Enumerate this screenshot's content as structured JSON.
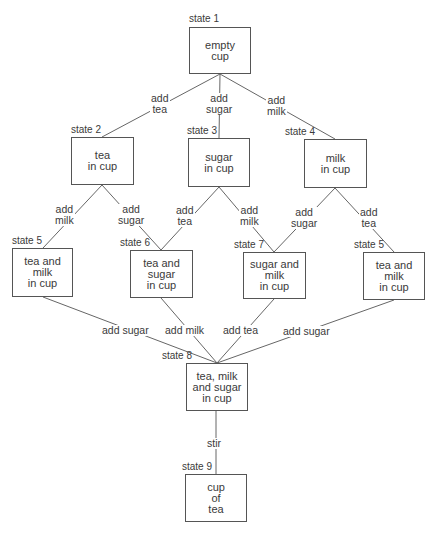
{
  "diagram": {
    "type": "state-transition-tree",
    "states": [
      {
        "id": "s1",
        "label": "state 1",
        "text": "empty\ncup",
        "x": 189,
        "y": 27,
        "w": 62,
        "h": 47
      },
      {
        "id": "s2",
        "label": "state 2",
        "text": "tea\nin cup",
        "x": 71,
        "y": 137,
        "w": 63,
        "h": 48
      },
      {
        "id": "s3",
        "label": "state 3",
        "text": "sugar\nin cup",
        "x": 188,
        "y": 138,
        "w": 62,
        "h": 49
      },
      {
        "id": "s4",
        "label": "state 4",
        "text": "milk\nin cup",
        "x": 304,
        "y": 139,
        "w": 63,
        "h": 49
      },
      {
        "id": "s5a",
        "label": "state 5",
        "text": "tea and\nmilk\nin cup",
        "x": 12,
        "y": 248,
        "w": 61,
        "h": 49
      },
      {
        "id": "s6",
        "label": "state 6",
        "text": "tea and\nsugar\nin cup",
        "x": 130,
        "y": 250,
        "w": 63,
        "h": 48
      },
      {
        "id": "s7",
        "label": "state 7",
        "text": "sugar and\nmilk\nin cup",
        "x": 243,
        "y": 252,
        "w": 63,
        "h": 47
      },
      {
        "id": "s5b",
        "label": "state 5",
        "text": "tea and\nmilk\nin cup",
        "x": 363,
        "y": 252,
        "w": 62,
        "h": 48
      },
      {
        "id": "s8",
        "label": "state 8",
        "text": "tea, milk\nand sugar\nin cup",
        "x": 186,
        "y": 363,
        "w": 62,
        "h": 48
      },
      {
        "id": "s9",
        "label": "state 9",
        "text": "cup\nof\ntea",
        "x": 185,
        "y": 474,
        "w": 62,
        "h": 48
      }
    ],
    "state_labels": {
      "s1": "state 1",
      "s2": "state 2",
      "s3": "state 3",
      "s4": "state 4",
      "s5a": "state 5",
      "s6": "state 6",
      "s7": "state 7",
      "s5b": "state 5",
      "s8": "state 8",
      "s9": "state 9"
    },
    "state_text": {
      "s1": "empty\ncup",
      "s2": "tea\nin cup",
      "s3": "sugar\nin cup",
      "s4": "milk\nin cup",
      "s5a": "tea and\nmilk\nin cup",
      "s6": "tea and\nsugar\nin cup",
      "s7": "sugar and\nmilk\nin cup",
      "s5b": "tea and\nmilk\nin cup",
      "s8": "tea, milk\nand sugar\nin cup",
      "s9": "cup\nof\ntea"
    },
    "transitions": [
      {
        "from": "s1",
        "to": "s2",
        "label": "add\ntea"
      },
      {
        "from": "s1",
        "to": "s3",
        "label": "add\nsugar"
      },
      {
        "from": "s1",
        "to": "s4",
        "label": "add\nmilk"
      },
      {
        "from": "s2",
        "to": "s5a",
        "label": "add\nmilk"
      },
      {
        "from": "s2",
        "to": "s6",
        "label": "add\nsugar"
      },
      {
        "from": "s3",
        "to": "s6",
        "label": "add\ntea"
      },
      {
        "from": "s3",
        "to": "s7",
        "label": "add\nmilk"
      },
      {
        "from": "s4",
        "to": "s7",
        "label": "add\nsugar"
      },
      {
        "from": "s4",
        "to": "s5b",
        "label": "add\ntea"
      },
      {
        "from": "s5a",
        "to": "s8",
        "label": "add sugar"
      },
      {
        "from": "s6",
        "to": "s8",
        "label": "add milk"
      },
      {
        "from": "s7",
        "to": "s8",
        "label": "add tea"
      },
      {
        "from": "s5b",
        "to": "s8",
        "label": "add sugar"
      },
      {
        "from": "s8",
        "to": "s9",
        "label": "stir"
      }
    ],
    "edge_labels": {
      "e1": "add\ntea",
      "e2": "add\nsugar",
      "e3": "add\nmilk",
      "e4": "add\nmilk",
      "e5": "add\nsugar",
      "e6": "add\ntea",
      "e7": "add\nmilk",
      "e8": "add\nsugar",
      "e9": "add\ntea",
      "e10": "add sugar",
      "e11": "add milk",
      "e12": "add tea",
      "e13": "add sugar",
      "e14": "stir"
    },
    "colors": {
      "line": "#666666",
      "border": "#555555",
      "text": "#3a3a3a",
      "background": "#ffffff"
    }
  }
}
